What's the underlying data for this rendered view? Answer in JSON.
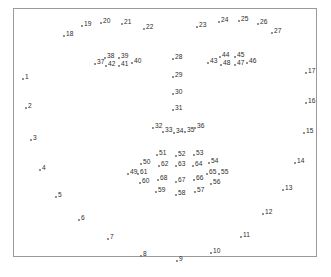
{
  "figure": {
    "title": "",
    "caption_partial": "",
    "frame": {
      "x": 13,
      "y": 8,
      "width": 304,
      "height": 249,
      "border_color": "#9a9a9a"
    },
    "marker_color": "#6d6d6d",
    "label_color": "#2b2b2b",
    "background": "#ffffff"
  },
  "chart_data": {
    "type": "scatter",
    "title": "",
    "xlabel": "",
    "ylabel": "",
    "grid": false,
    "legend": null,
    "xlim": [
      13,
      317
    ],
    "ylim": [
      8,
      257
    ],
    "axis_inverted_y": true,
    "point_label_position": "right",
    "series": [
      {
        "name": "facial-landmarks",
        "labels": [
          "1",
          "2",
          "3",
          "4",
          "5",
          "6",
          "7",
          "8",
          "9",
          "10",
          "11",
          "12",
          "13",
          "14",
          "15",
          "16",
          "17",
          "18",
          "19",
          "20",
          "21",
          "22",
          "23",
          "24",
          "25",
          "26",
          "27",
          "28",
          "29",
          "30",
          "31",
          "32",
          "33",
          "34",
          "35",
          "36",
          "37",
          "38",
          "39",
          "40",
          "41",
          "42",
          "43",
          "44",
          "45",
          "46",
          "47",
          "48",
          "49",
          "50",
          "51",
          "52",
          "53",
          "54",
          "55",
          "56",
          "57",
          "58",
          "59",
          "60",
          "61",
          "62",
          "63",
          "64",
          "65",
          "66",
          "67",
          "68"
        ],
        "points": [
          {
            "label": "1",
            "x": 21,
            "y": 77
          },
          {
            "label": "2",
            "x": 24,
            "y": 106
          },
          {
            "label": "3",
            "x": 29,
            "y": 138
          },
          {
            "label": "4",
            "x": 38,
            "y": 168
          },
          {
            "label": "5",
            "x": 54,
            "y": 195
          },
          {
            "label": "6",
            "x": 77,
            "y": 218
          },
          {
            "label": "7",
            "x": 106,
            "y": 237
          },
          {
            "label": "8",
            "x": 139,
            "y": 254
          },
          {
            "label": "9",
            "x": 175,
            "y": 259
          },
          {
            "label": "10",
            "x": 209,
            "y": 251
          },
          {
            "label": "11",
            "x": 239,
            "y": 235
          },
          {
            "label": "12",
            "x": 261,
            "y": 212
          },
          {
            "label": "13",
            "x": 281,
            "y": 188
          },
          {
            "label": "14",
            "x": 293,
            "y": 161
          },
          {
            "label": "15",
            "x": 302,
            "y": 131
          },
          {
            "label": "16",
            "x": 304,
            "y": 101
          },
          {
            "label": "17",
            "x": 304,
            "y": 71
          },
          {
            "label": "18",
            "x": 62,
            "y": 34
          },
          {
            "label": "19",
            "x": 80,
            "y": 24
          },
          {
            "label": "20",
            "x": 99,
            "y": 21
          },
          {
            "label": "21",
            "x": 120,
            "y": 22
          },
          {
            "label": "22",
            "x": 142,
            "y": 27
          },
          {
            "label": "23",
            "x": 195,
            "y": 25
          },
          {
            "label": "24",
            "x": 217,
            "y": 20
          },
          {
            "label": "25",
            "x": 237,
            "y": 19
          },
          {
            "label": "26",
            "x": 256,
            "y": 22
          },
          {
            "label": "27",
            "x": 270,
            "y": 31
          },
          {
            "label": "28",
            "x": 171,
            "y": 57
          },
          {
            "label": "29",
            "x": 171,
            "y": 75
          },
          {
            "label": "30",
            "x": 171,
            "y": 92
          },
          {
            "label": "31",
            "x": 171,
            "y": 108
          },
          {
            "label": "32",
            "x": 151,
            "y": 126
          },
          {
            "label": "33",
            "x": 161,
            "y": 130
          },
          {
            "label": "34",
            "x": 172,
            "y": 131
          },
          {
            "label": "35",
            "x": 183,
            "y": 130
          },
          {
            "label": "36",
            "x": 193,
            "y": 126
          },
          {
            "label": "37",
            "x": 93,
            "y": 62
          },
          {
            "label": "38",
            "x": 103,
            "y": 56
          },
          {
            "label": "39",
            "x": 117,
            "y": 56
          },
          {
            "label": "40",
            "x": 130,
            "y": 61
          },
          {
            "label": "41",
            "x": 117,
            "y": 64
          },
          {
            "label": "42",
            "x": 104,
            "y": 64
          },
          {
            "label": "43",
            "x": 206,
            "y": 61
          },
          {
            "label": "44",
            "x": 218,
            "y": 55
          },
          {
            "label": "45",
            "x": 233,
            "y": 55
          },
          {
            "label": "46",
            "x": 245,
            "y": 61
          },
          {
            "label": "47",
            "x": 233,
            "y": 63
          },
          {
            "label": "48",
            "x": 219,
            "y": 63
          },
          {
            "label": "49",
            "x": 126,
            "y": 172
          },
          {
            "label": "50",
            "x": 139,
            "y": 162
          },
          {
            "label": "51",
            "x": 155,
            "y": 153
          },
          {
            "label": "52",
            "x": 174,
            "y": 154
          },
          {
            "label": "53",
            "x": 192,
            "y": 153
          },
          {
            "label": "54",
            "x": 207,
            "y": 161
          },
          {
            "label": "55",
            "x": 217,
            "y": 172
          },
          {
            "label": "56",
            "x": 209,
            "y": 182
          },
          {
            "label": "57",
            "x": 193,
            "y": 190
          },
          {
            "label": "58",
            "x": 174,
            "y": 193
          },
          {
            "label": "59",
            "x": 154,
            "y": 190
          },
          {
            "label": "60",
            "x": 138,
            "y": 181
          },
          {
            "label": "61",
            "x": 136,
            "y": 172
          },
          {
            "label": "62",
            "x": 157,
            "y": 164
          },
          {
            "label": "63",
            "x": 174,
            "y": 164
          },
          {
            "label": "64",
            "x": 191,
            "y": 164
          },
          {
            "label": "65",
            "x": 205,
            "y": 172
          },
          {
            "label": "66",
            "x": 192,
            "y": 178
          },
          {
            "label": "67",
            "x": 174,
            "y": 180
          },
          {
            "label": "68",
            "x": 156,
            "y": 178
          }
        ]
      }
    ]
  }
}
